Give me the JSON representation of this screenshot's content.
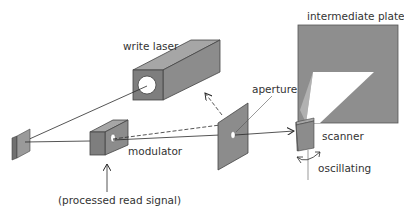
{
  "labels": {
    "write_laser": "write laser",
    "intermediate_plate": "intermediate plate",
    "aperture": "aperture",
    "scanner": "scanner",
    "modulator": "modulator",
    "oscillating": "oscillating",
    "processed_read_signal": "(processed read signal)"
  },
  "colors": {
    "component_fill": "#8c8c8c",
    "component_dark": "#707070",
    "component_light": "#a6a6a6",
    "plate_fill": "#8e8e8e",
    "beam": "#2a2a2a",
    "background": "#ffffff",
    "text": "#333333"
  }
}
